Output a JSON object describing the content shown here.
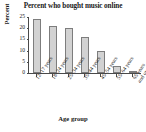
{
  "chart_data": {
    "type": "bar",
    "title": "Percent who bought music online",
    "xlabel": "Age group",
    "ylabel": "Percent",
    "categories": [
      "12–17 years",
      "18–24 years",
      "25–34 years",
      "35–44 years",
      "45–54 years",
      "55–64 years",
      "65 years and over"
    ],
    "category_lines": [
      [
        "12–17 years"
      ],
      [
        "18–24 years"
      ],
      [
        "25–34 years"
      ],
      [
        "35–44 years"
      ],
      [
        "45–54 years"
      ],
      [
        "55–64 years"
      ],
      [
        "65 years",
        "and over"
      ]
    ],
    "values": [
      24,
      21,
      20,
      16,
      10,
      3,
      1
    ],
    "ylim": [
      0,
      25
    ],
    "yticks": [
      0,
      5,
      10,
      15,
      20,
      25
    ],
    "ytick_labels": [
      "0",
      "5",
      "10",
      "15",
      "20",
      "25"
    ],
    "grid": false,
    "legend": null,
    "colors": {
      "bar_fill": "#d2d2d2",
      "bar_border": "#7d7d7d",
      "axis": "#4a4a4a",
      "text": "#1a1a1a",
      "background": "#ffffff"
    }
  }
}
